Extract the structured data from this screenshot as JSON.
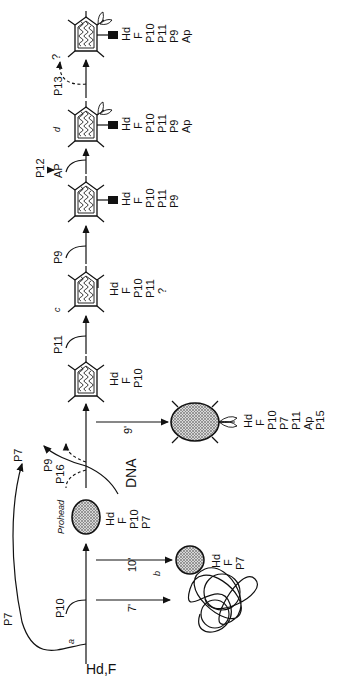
{
  "diagram": {
    "orientation": "rotated 90 degrees counter-clockwise",
    "start_label": "Hd,F",
    "start_superscript": "a",
    "steps": {
      "p10": "P10",
      "p7_loop_start": "P7",
      "p7_loop_end": "P7",
      "p9": "P9",
      "p16": "P16",
      "dna": "DNA",
      "p11": "P11",
      "p9b": "P9",
      "p12": "P12",
      "ap": "AP",
      "p13": "P13",
      "question": "?"
    },
    "prohead": {
      "label": "Prohead",
      "components": [
        "Hd",
        "F",
        "P10",
        "P7"
      ]
    },
    "branches": [
      {
        "time": "7'",
        "superscript": "b",
        "product": "tangled-filament",
        "components": []
      },
      {
        "time": "10'",
        "product": "sphere",
        "components": [
          "Hd",
          "F",
          "P7"
        ]
      },
      {
        "time": "9'",
        "product": "oval-with-tail",
        "components": [
          "Hd",
          "F",
          "P10",
          "P7",
          "P11",
          "Ap",
          "P15"
        ]
      }
    ],
    "intermediates": [
      {
        "letter": "",
        "components": [
          "Hd",
          "F",
          "P10"
        ]
      },
      {
        "letter": "c",
        "components": [
          "Hd",
          "F",
          "P10",
          "P11",
          "?"
        ]
      },
      {
        "letter": "",
        "components": [
          "Hd",
          "F",
          "P10",
          "P11",
          "P9"
        ]
      },
      {
        "letter": "d",
        "components": [
          "Hd",
          "F",
          "P10",
          "P11",
          "P9",
          "Ap"
        ]
      },
      {
        "letter": "",
        "components": [
          "Hd",
          "F",
          "P10",
          "P11",
          "P9",
          "Ap"
        ]
      }
    ],
    "colors": {
      "ink": "#111111",
      "background": "#ffffff",
      "stipple": "#8a8a8a"
    }
  }
}
